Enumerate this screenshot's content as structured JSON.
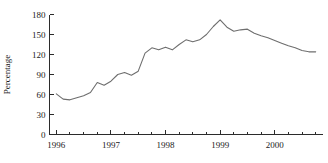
{
  "chart_data": {
    "type": "line",
    "title": "",
    "xlabel": "",
    "ylabel": "Percentage",
    "xlim": [
      1995.875,
      2000.875
    ],
    "ylim": [
      0,
      180
    ],
    "grid": false,
    "legend": null,
    "y_ticks": [
      0,
      30,
      60,
      90,
      120,
      150,
      180
    ],
    "y_tick_labels": [
      "0",
      "30",
      "60",
      "90",
      "120",
      "150",
      "180"
    ],
    "x_tick_labels": [
      "1996",
      "1997",
      "1998",
      "1999",
      "2000"
    ],
    "x_tick_label_positions": [
      1996,
      1997,
      1998,
      1999,
      2000
    ],
    "x_minor_ticks": [
      1996.0,
      1996.25,
      1996.5,
      1996.75,
      1997.0,
      1997.25,
      1997.5,
      1997.75,
      1998.0,
      1998.25,
      1998.5,
      1998.75,
      1999.0,
      1999.25,
      1999.5,
      1999.75,
      2000.0,
      2000.25,
      2000.5,
      2000.75
    ],
    "line_color": "#6e6e6e",
    "axis_color": "#2b2b2b",
    "series": [
      {
        "name": "Percentage",
        "x": [
          1996.0,
          1996.125,
          1996.25,
          1996.375,
          1996.5,
          1996.625,
          1996.75,
          1996.875,
          1997.0,
          1997.125,
          1997.25,
          1997.375,
          1997.5,
          1997.625,
          1997.75,
          1997.875,
          1998.0,
          1998.125,
          1998.25,
          1998.375,
          1998.5,
          1998.625,
          1998.75,
          1998.875,
          1999.0,
          1999.125,
          1999.25,
          1999.375,
          1999.5,
          1999.625,
          1999.75,
          1999.875,
          2000.0,
          2000.125,
          2000.25,
          2000.375,
          2000.5,
          2000.625,
          2000.75
        ],
        "y": [
          61,
          53,
          52,
          55,
          58,
          63,
          78,
          74,
          80,
          90,
          93,
          89,
          95,
          122,
          130,
          127,
          131,
          127,
          135,
          142,
          139,
          142,
          150,
          162,
          172,
          161,
          155,
          157,
          158,
          152,
          148,
          145,
          141,
          137,
          133,
          130,
          126,
          124,
          124
        ]
      }
    ]
  }
}
